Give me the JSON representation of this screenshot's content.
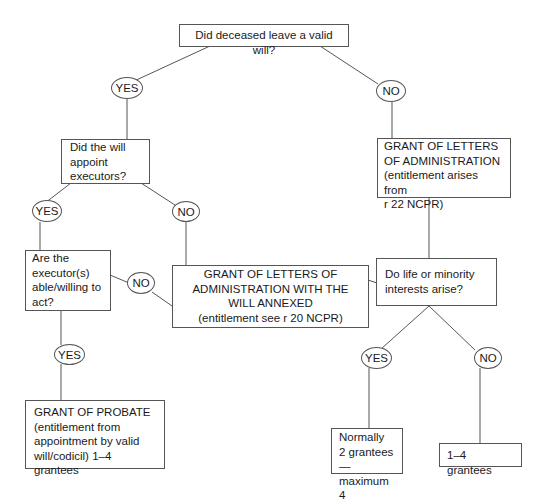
{
  "diagram": {
    "type": "flowchart",
    "nodes": {
      "q_valid_will": "Did deceased leave a valid will?",
      "q_appoint_executors": "Did the will\nappoint\nexecutors?",
      "grant_letters_admin": "GRANT OF LETTERS\nOF ADMINISTRATION\n(entitlement arises from\nr 22 NCPR)",
      "q_executors_able": "Are the\nexecutor(s)\nable/willing to\nact?",
      "grant_will_annexed": "GRANT OF LETTERS OF\nADMINISTRATION WITH THE\nWILL ANNEXED\n(entitlement see r 20 NCPR)",
      "q_life_minority": "Do life or minority\ninterests arise?",
      "grant_probate": "GRANT OF PROBATE\n(entitlement from\nappointment by valid\nwill/codicil) 1–4 grantees",
      "normally_2": "Normally\n2 grantees—\nmaximum 4",
      "grantees_1_4": "1–4 grantees"
    },
    "labels": {
      "yes1": "YES",
      "no1": "NO",
      "yes2": "YES",
      "no2": "NO",
      "no3": "NO",
      "yes3": "YES",
      "yes4": "YES",
      "no4": "NO"
    },
    "edges": [
      {
        "from": "q_valid_will",
        "label": "YES",
        "to": "q_appoint_executors"
      },
      {
        "from": "q_valid_will",
        "label": "NO",
        "to": "grant_letters_admin"
      },
      {
        "from": "q_appoint_executors",
        "label": "YES",
        "to": "q_executors_able"
      },
      {
        "from": "q_appoint_executors",
        "label": "NO",
        "to": "grant_will_annexed"
      },
      {
        "from": "q_executors_able",
        "label": "NO",
        "to": "grant_will_annexed"
      },
      {
        "from": "q_executors_able",
        "label": "YES",
        "to": "grant_probate"
      },
      {
        "from": "grant_letters_admin",
        "label": "",
        "to": "q_life_minority"
      },
      {
        "from": "grant_will_annexed",
        "label": "",
        "to": "q_life_minority"
      },
      {
        "from": "q_life_minority",
        "label": "YES",
        "to": "normally_2"
      },
      {
        "from": "q_life_minority",
        "label": "NO",
        "to": "grantees_1_4"
      }
    ]
  }
}
